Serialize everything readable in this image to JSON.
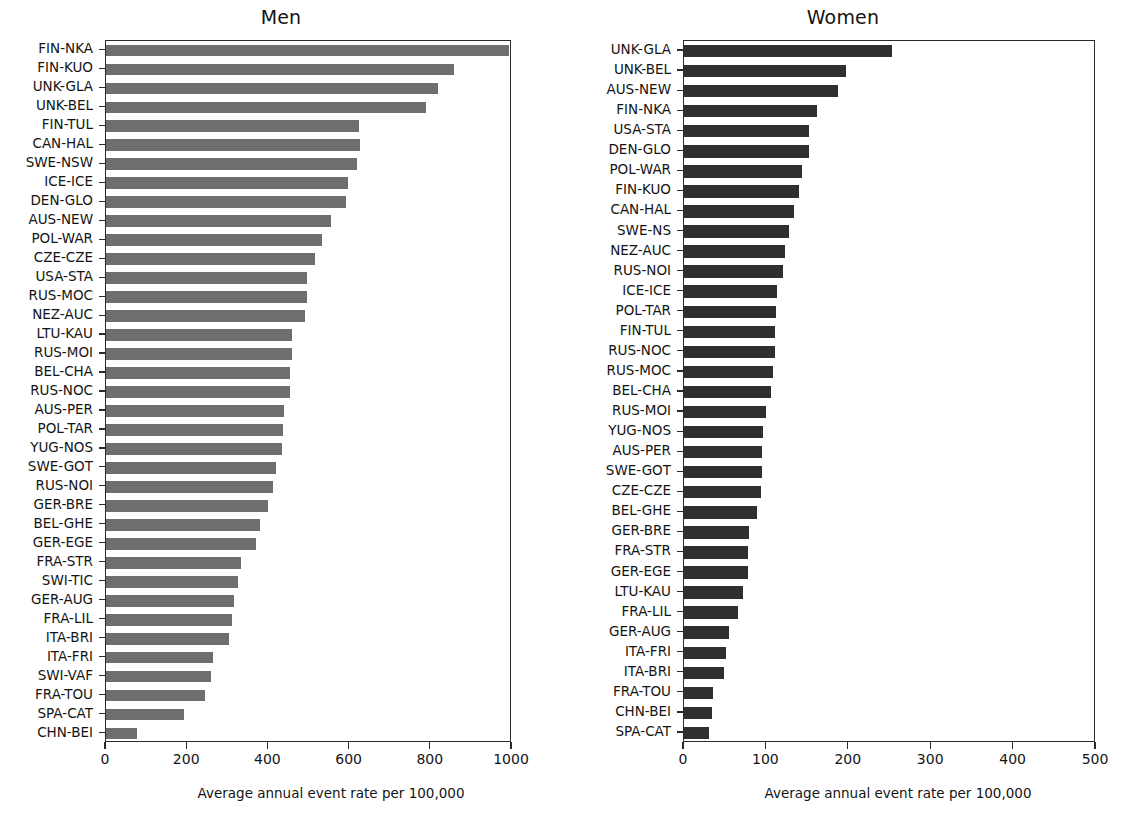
{
  "figure": {
    "width": 1125,
    "height": 822,
    "background": "#ffffff"
  },
  "panels": [
    {
      "key": "men",
      "title": "Men",
      "bar_color": "#6e6e6e",
      "xaxis_title": "Average annual event rate per 100,000",
      "xticks": [
        0,
        200,
        400,
        600,
        800,
        1000
      ]
    },
    {
      "key": "women",
      "title": "Women",
      "bar_color": "#2f2f2f",
      "xaxis_title": "Average annual event rate per 100,000",
      "xticks": [
        0,
        100,
        200,
        300,
        400,
        500
      ]
    }
  ],
  "chart_data": [
    {
      "type": "bar",
      "orientation": "horizontal",
      "title": "Men",
      "xlabel": "Average annual event rate per 100,000",
      "ylabel": "",
      "xlim": [
        0,
        1000
      ],
      "xticks": [
        0,
        200,
        400,
        600,
        800,
        1000
      ],
      "grid": false,
      "legend": "none",
      "bar_color": "#6e6e6e",
      "categories": [
        "FIN-NKA",
        "FIN-KUO",
        "UNK-GLA",
        "UNK-BEL",
        "FIN-TUL",
        "CAN-HAL",
        "SWE-NSW",
        "ICE-ICE",
        "DEN-GLO",
        "AUS-NEW",
        "POL-WAR",
        "CZE-CZE",
        "USA-STA",
        "RUS-MOC",
        "NEZ-AUC",
        "LTU-KAU",
        "RUS-MOI",
        "BEL-CHA",
        "RUS-NOC",
        "AUS-PER",
        "POL-TAR",
        "YUG-NOS",
        "SWE-GOT",
        "RUS-NOI",
        "GER-BRE",
        "BEL-GHE",
        "GER-EGE",
        "FRA-STR",
        "SWI-TIC",
        "GER-AUG",
        "FRA-LIL",
        "ITA-BRI",
        "ITA-FRI",
        "SWI-VAF",
        "FRA-TOU",
        "SPA-CAT",
        "CHN-BEI"
      ],
      "values": [
        993,
        857,
        817,
        787,
        622,
        625,
        617,
        597,
        592,
        555,
        531,
        516,
        494,
        494,
        491,
        457,
        457,
        454,
        452,
        439,
        437,
        433,
        418,
        412,
        400,
        379,
        370,
        333,
        326,
        316,
        310,
        304,
        264,
        259,
        245,
        193,
        77
      ]
    },
    {
      "type": "bar",
      "orientation": "horizontal",
      "title": "Women",
      "xlabel": "Average annual event rate per 100,000",
      "ylabel": "",
      "xlim": [
        0,
        500
      ],
      "xticks": [
        0,
        100,
        200,
        300,
        400,
        500
      ],
      "grid": false,
      "legend": "none",
      "bar_color": "#2f2f2f",
      "categories": [
        "UNK-GLA",
        "UNK-BEL",
        "AUS-NEW",
        "FIN-NKA",
        "USA-STA",
        "DEN-GLO",
        "POL-WAR",
        "FIN-KUO",
        "CAN-HAL",
        "SWE-NS",
        "NEZ-AUC",
        "RUS-NOI",
        "ICE-ICE",
        "POL-TAR",
        "FIN-TUL",
        "RUS-NOC",
        "RUS-MOC",
        "BEL-CHA",
        "RUS-MOI",
        "YUG-NOS",
        "AUS-PER",
        "SWE-GOT",
        "CZE-CZE",
        "BEL-GHE",
        "GER-BRE",
        "FRA-STR",
        "GER-EGE",
        "LTU-KAU",
        "FRA-LIL",
        "GER-AUG",
        "ITA-FRI",
        "ITA-BRI",
        "FRA-TOU",
        "CHN-BEI",
        "SPA-CAT"
      ],
      "values": [
        252,
        196,
        187,
        161,
        152,
        152,
        143,
        139,
        134,
        128,
        122,
        120,
        113,
        112,
        111,
        110,
        108,
        105,
        99,
        96,
        95,
        95,
        93,
        88,
        79,
        78,
        78,
        72,
        66,
        55,
        51,
        49,
        35,
        34,
        30
      ]
    }
  ]
}
